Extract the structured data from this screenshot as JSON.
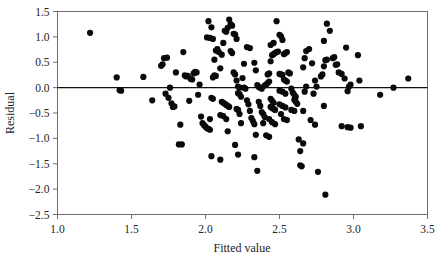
{
  "chart_data": {
    "type": "scatter",
    "title": "",
    "xlabel": "Fitted value",
    "ylabel": "Residual",
    "xlim": [
      1.0,
      3.5
    ],
    "ylim": [
      -2.5,
      1.5
    ],
    "xticks": [
      "1.0",
      "1.5",
      "2.0",
      "2.5",
      "3.0",
      "3.5"
    ],
    "xtick_values": [
      1.0,
      1.5,
      2.0,
      2.5,
      3.0,
      3.5
    ],
    "yticks": [
      "1.5",
      "1.0",
      "0.5",
      "0.0",
      "-0.5",
      "-1.0",
      "-1.5",
      "-2.0",
      "-2.5"
    ],
    "ytick_values": [
      1.5,
      1.0,
      0.5,
      0.0,
      -0.5,
      -1.0,
      -1.5,
      -2.0,
      -2.5
    ],
    "grid": false,
    "legend": null,
    "reference_line": {
      "type": "horizontal",
      "y": 0.0,
      "color": "#111111"
    },
    "marker": {
      "shape": "circle",
      "color": "#0a0a0a",
      "size": 3.1
    },
    "point_count": 203,
    "points": [
      [
        1.22,
        1.08
      ],
      [
        1.4,
        0.2
      ],
      [
        1.42,
        -0.05
      ],
      [
        1.43,
        -0.06
      ],
      [
        1.58,
        0.21
      ],
      [
        1.64,
        -0.25
      ],
      [
        1.7,
        0.43
      ],
      [
        1.71,
        0.46
      ],
      [
        1.72,
        0.58
      ],
      [
        1.74,
        0.59
      ],
      [
        1.73,
        -0.12
      ],
      [
        1.75,
        -0.2
      ],
      [
        1.76,
        0.0
      ],
      [
        1.77,
        -0.31
      ],
      [
        1.78,
        -0.38
      ],
      [
        1.79,
        -0.37
      ],
      [
        1.8,
        0.3
      ],
      [
        1.82,
        -1.12
      ],
      [
        1.84,
        -1.12
      ],
      [
        1.83,
        -0.73
      ],
      [
        1.85,
        0.7
      ],
      [
        1.86,
        0.24
      ],
      [
        1.87,
        0.22
      ],
      [
        1.88,
        0.23
      ],
      [
        1.89,
        -0.26
      ],
      [
        1.9,
        0.17
      ],
      [
        1.91,
        0.16
      ],
      [
        1.92,
        0.28
      ],
      [
        1.93,
        0.31
      ],
      [
        1.94,
        0.3
      ],
      [
        1.95,
        -0.14
      ],
      [
        1.96,
        0.06
      ],
      [
        1.97,
        -0.57
      ],
      [
        1.98,
        -0.7
      ],
      [
        1.99,
        -0.74
      ],
      [
        2.0,
        -0.77
      ],
      [
        2.01,
        -0.8
      ],
      [
        2.02,
        -0.81
      ],
      [
        2.03,
        -0.83
      ],
      [
        2.01,
        0.99
      ],
      [
        2.03,
        0.98
      ],
      [
        2.05,
        0.96
      ],
      [
        2.02,
        1.31
      ],
      [
        2.04,
        1.19
      ],
      [
        2.06,
        0.55
      ],
      [
        2.07,
        0.73
      ],
      [
        2.08,
        0.76
      ],
      [
        2.09,
        0.7
      ],
      [
        2.06,
        0.24
      ],
      [
        2.07,
        0.23
      ],
      [
        2.05,
        0.2
      ],
      [
        2.04,
        -0.2
      ],
      [
        2.05,
        -0.22
      ],
      [
        2.03,
        -0.62
      ],
      [
        2.04,
        -1.35
      ],
      [
        2.1,
        -1.42
      ],
      [
        2.1,
        0.38
      ],
      [
        2.11,
        0.65
      ],
      [
        2.12,
        0.88
      ],
      [
        2.13,
        1.12
      ],
      [
        2.14,
        1.1
      ],
      [
        2.15,
        1.18
      ],
      [
        2.16,
        1.34
      ],
      [
        2.17,
        1.25
      ],
      [
        2.18,
        1.22
      ],
      [
        2.19,
        1.06
      ],
      [
        2.2,
        1.05
      ],
      [
        2.21,
        0.96
      ],
      [
        2.11,
        -0.28
      ],
      [
        2.12,
        -0.3
      ],
      [
        2.13,
        -0.32
      ],
      [
        2.14,
        -0.34
      ],
      [
        2.15,
        -0.36
      ],
      [
        2.16,
        -0.38
      ],
      [
        2.1,
        -0.54
      ],
      [
        2.12,
        -0.56
      ],
      [
        2.14,
        -0.62
      ],
      [
        2.15,
        -0.86
      ],
      [
        2.17,
        0.72
      ],
      [
        2.18,
        0.68
      ],
      [
        2.19,
        0.3
      ],
      [
        2.2,
        0.26
      ],
      [
        2.21,
        0.14
      ],
      [
        2.22,
        0.02
      ],
      [
        2.23,
        0.0
      ],
      [
        2.22,
        -0.11
      ],
      [
        2.23,
        -0.13
      ],
      [
        2.24,
        -0.18
      ],
      [
        2.21,
        -0.42
      ],
      [
        2.22,
        -0.44
      ],
      [
        2.23,
        -0.52
      ],
      [
        2.24,
        -0.7
      ],
      [
        2.2,
        -1.13
      ],
      [
        2.22,
        -1.32
      ],
      [
        2.25,
        0.19
      ],
      [
        2.26,
        0.0
      ],
      [
        2.27,
        -0.02
      ],
      [
        2.28,
        -0.25
      ],
      [
        2.29,
        -0.33
      ],
      [
        2.3,
        -0.46
      ],
      [
        2.31,
        -0.6
      ],
      [
        2.32,
        -0.66
      ],
      [
        2.33,
        -0.72
      ],
      [
        2.34,
        -0.93
      ],
      [
        2.33,
        -1.37
      ],
      [
        2.35,
        -1.64
      ],
      [
        2.26,
        0.47
      ],
      [
        2.28,
        0.8
      ],
      [
        2.3,
        0.78
      ],
      [
        2.33,
        0.49
      ],
      [
        2.34,
        0.34
      ],
      [
        2.35,
        0.05
      ],
      [
        2.36,
        0.01
      ],
      [
        2.37,
        0.0
      ],
      [
        2.38,
        -0.02
      ],
      [
        2.36,
        -0.28
      ],
      [
        2.37,
        -0.36
      ],
      [
        2.38,
        -0.48
      ],
      [
        2.39,
        -0.52
      ],
      [
        2.4,
        -0.58
      ],
      [
        2.39,
        -0.7
      ],
      [
        2.4,
        0.04
      ],
      [
        2.41,
        0.06
      ],
      [
        2.42,
        0.09
      ],
      [
        2.43,
        0.12
      ],
      [
        2.42,
        0.26
      ],
      [
        2.43,
        0.28
      ],
      [
        2.44,
        0.52
      ],
      [
        2.45,
        0.64
      ],
      [
        2.46,
        0.66
      ],
      [
        2.47,
        0.68
      ],
      [
        2.48,
        0.7
      ],
      [
        2.49,
        0.71
      ],
      [
        2.44,
        0.84
      ],
      [
        2.46,
        0.88
      ],
      [
        2.48,
        1.31
      ],
      [
        2.5,
        1.04
      ],
      [
        2.51,
        1.01
      ],
      [
        2.52,
        0.94
      ],
      [
        2.44,
        -0.22
      ],
      [
        2.45,
        -0.26
      ],
      [
        2.46,
        -0.3
      ],
      [
        2.44,
        -0.38
      ],
      [
        2.45,
        -0.4
      ],
      [
        2.46,
        -0.42
      ],
      [
        2.47,
        -0.44
      ],
      [
        2.43,
        -0.62
      ],
      [
        2.45,
        -0.68
      ],
      [
        2.47,
        -0.72
      ],
      [
        2.41,
        -0.94
      ],
      [
        2.43,
        -0.97
      ],
      [
        2.5,
        0.27
      ],
      [
        2.51,
        0.26
      ],
      [
        2.52,
        0.25
      ],
      [
        2.53,
        0.66
      ],
      [
        2.54,
        0.68
      ],
      [
        2.55,
        0.7
      ],
      [
        2.53,
        0.16
      ],
      [
        2.54,
        0.14
      ],
      [
        2.55,
        0.12
      ],
      [
        2.5,
        -0.06
      ],
      [
        2.52,
        -0.08
      ],
      [
        2.54,
        -0.12
      ],
      [
        2.5,
        -0.33
      ],
      [
        2.52,
        -0.36
      ],
      [
        2.54,
        -0.39
      ],
      [
        2.51,
        -0.52
      ],
      [
        2.53,
        -0.62
      ],
      [
        2.55,
        -0.64
      ],
      [
        2.56,
        0.3
      ],
      [
        2.57,
        0.28
      ],
      [
        2.58,
        -0.02
      ],
      [
        2.59,
        -0.1
      ],
      [
        2.6,
        -0.14
      ],
      [
        2.61,
        -0.18
      ],
      [
        2.6,
        -0.24
      ],
      [
        2.61,
        -0.28
      ],
      [
        2.62,
        -0.32
      ],
      [
        2.58,
        -0.44
      ],
      [
        2.6,
        -0.46
      ],
      [
        2.63,
        -1.02
      ],
      [
        2.64,
        -1.25
      ],
      [
        2.64,
        -1.53
      ],
      [
        2.65,
        -1.55
      ],
      [
        2.66,
        -1.1
      ],
      [
        2.66,
        -0.46
      ],
      [
        2.67,
        -0.08
      ],
      [
        2.68,
        0.02
      ],
      [
        2.66,
        0.4
      ],
      [
        2.67,
        0.58
      ],
      [
        2.68,
        0.72
      ],
      [
        2.7,
        0.76
      ],
      [
        2.72,
        0.48
      ],
      [
        2.74,
        0.14
      ],
      [
        2.75,
        0.02
      ],
      [
        2.73,
        -0.12
      ],
      [
        2.71,
        -0.64
      ],
      [
        2.74,
        -0.73
      ],
      [
        2.76,
        -1.66
      ],
      [
        2.78,
        0.22
      ],
      [
        2.79,
        0.26
      ],
      [
        2.8,
        0.42
      ],
      [
        2.81,
        0.54
      ],
      [
        2.82,
        0.55
      ],
      [
        2.8,
        0.92
      ],
      [
        2.82,
        1.26
      ],
      [
        2.84,
        1.12
      ],
      [
        2.8,
        -0.36
      ],
      [
        2.81,
        -2.11
      ],
      [
        2.86,
        0.58
      ],
      [
        2.87,
        0.6
      ],
      [
        2.88,
        0.45
      ],
      [
        2.89,
        0.46
      ],
      [
        2.9,
        0.3
      ],
      [
        2.92,
        0.27
      ],
      [
        2.94,
        0.18
      ],
      [
        2.95,
        0.79
      ],
      [
        2.96,
        -0.07
      ],
      [
        2.97,
        0.02
      ],
      [
        2.98,
        0.06
      ],
      [
        2.96,
        -0.78
      ],
      [
        2.98,
        -0.79
      ],
      [
        2.92,
        -0.76
      ],
      [
        3.03,
        0.64
      ],
      [
        3.04,
        0.14
      ],
      [
        3.05,
        -0.76
      ],
      [
        3.18,
        -0.14
      ],
      [
        3.27,
        0.0
      ],
      [
        3.37,
        0.18
      ]
    ]
  },
  "axis": {
    "x_title": "Fitted value",
    "y_title": "Residual"
  }
}
